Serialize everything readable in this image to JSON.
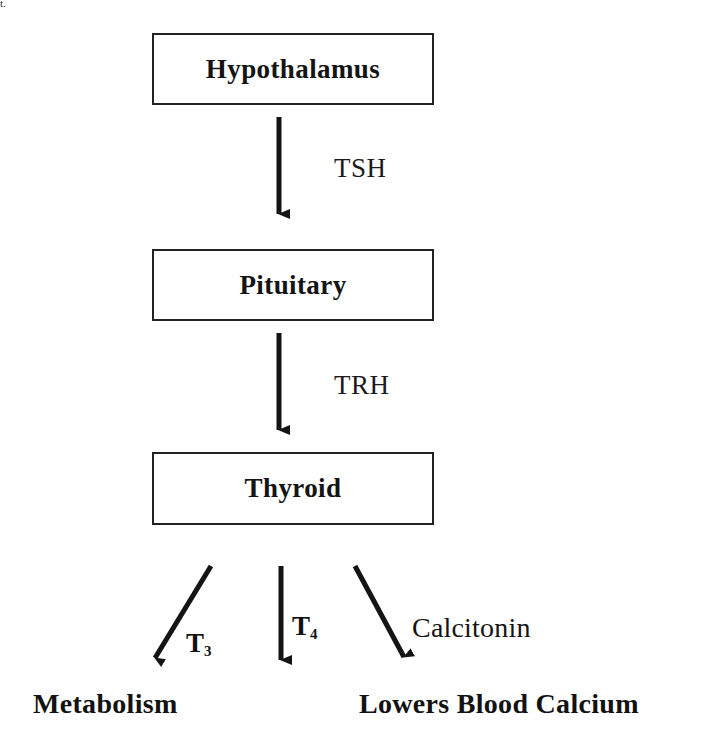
{
  "diagram": {
    "type": "flowchart",
    "background_color": "#ffffff",
    "stroke_color": "#222222",
    "text_color": "#141414",
    "corner_artifact": "t.",
    "nodes": [
      {
        "id": "hypothalamus",
        "label": "Hypothalamus",
        "x": 152,
        "y": 33,
        "width": 282,
        "height": 72
      },
      {
        "id": "pituitary",
        "label": "Pituitary",
        "x": 152,
        "y": 249,
        "width": 282,
        "height": 72
      },
      {
        "id": "thyroid",
        "label": "Thyroid",
        "x": 152,
        "y": 452,
        "width": 282,
        "height": 73
      }
    ],
    "edges": [
      {
        "id": "hypothalamus-to-pituitary",
        "label": "TSH",
        "from": "hypothalamus",
        "to": "pituitary",
        "label_x": 334,
        "label_y": 153
      },
      {
        "id": "pituitary-to-thyroid",
        "label": "TRH",
        "from": "pituitary",
        "to": "thyroid",
        "label_x": 334,
        "label_y": 370
      }
    ],
    "outputs": [
      {
        "id": "t3",
        "hormone": "T",
        "subscript": "3",
        "label_x": 186,
        "label_y": 628,
        "target": "Metabolism"
      },
      {
        "id": "t4",
        "hormone": "T",
        "subscript": "4",
        "label_x": 292,
        "label_y": 611,
        "target": ""
      },
      {
        "id": "calcitonin",
        "hormone": "Calcitonin",
        "subscript": "",
        "label_x": 412,
        "label_y": 612,
        "target": "Lowers Blood Calcium"
      }
    ],
    "outcomes": [
      {
        "id": "metabolism",
        "label": "Metabolism",
        "x": 33,
        "y": 688
      },
      {
        "id": "lowers-blood-calcium",
        "label": "Lowers Blood Calcium",
        "x": 359,
        "y": 688
      }
    ]
  }
}
